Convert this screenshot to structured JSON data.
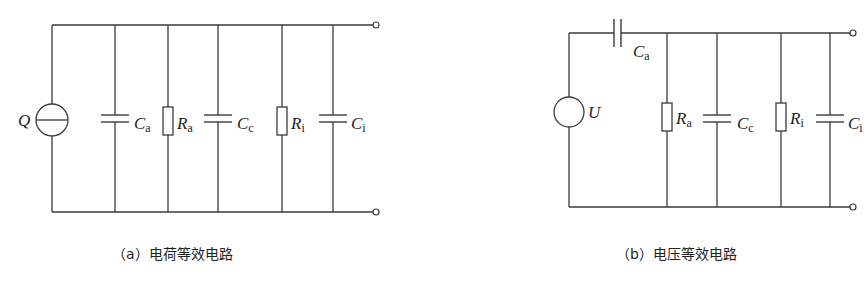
{
  "diagram_a": {
    "caption": "（a）电荷等效电路",
    "source_label": "Q",
    "source_type": "charge-source",
    "components": [
      {
        "type": "capacitor",
        "symbol": "C",
        "subscript": "a"
      },
      {
        "type": "resistor",
        "symbol": "R",
        "subscript": "a"
      },
      {
        "type": "capacitor",
        "symbol": "C",
        "subscript": "c"
      },
      {
        "type": "resistor",
        "symbol": "R",
        "subscript": "i"
      },
      {
        "type": "capacitor",
        "symbol": "C",
        "subscript": "i"
      }
    ]
  },
  "diagram_b": {
    "caption": "（b）电压等效电路",
    "source_label": "U",
    "source_type": "voltage-source",
    "series_component": {
      "type": "capacitor",
      "symbol": "C",
      "subscript": "a"
    },
    "components": [
      {
        "type": "resistor",
        "symbol": "R",
        "subscript": "a"
      },
      {
        "type": "capacitor",
        "symbol": "C",
        "subscript": "c"
      },
      {
        "type": "resistor",
        "symbol": "R",
        "subscript": "i"
      },
      {
        "type": "capacitor",
        "symbol": "C",
        "subscript": "i"
      }
    ]
  }
}
